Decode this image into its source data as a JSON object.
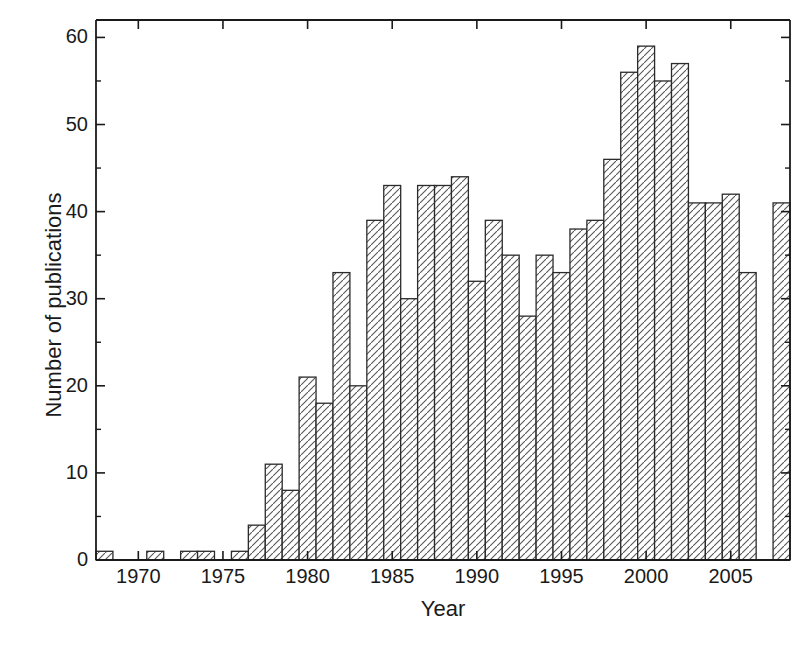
{
  "chart_data": {
    "type": "bar",
    "title": "",
    "subtitle": "",
    "xlabel": "Year",
    "ylabel": "Number of publications",
    "xlim": [
      1967.5,
      2008.5
    ],
    "ylim": [
      0,
      62
    ],
    "grid": false,
    "legend": null,
    "bar_style": {
      "fill": "#ffffff",
      "edge": "#2b2b2b",
      "hatch": "diagonal-forward-slash",
      "hatch_color": "#4a4a4a"
    },
    "axis_color": "#1a1a1a",
    "y_major_ticks": [
      0,
      10,
      20,
      30,
      40,
      50,
      60
    ],
    "y_minor_ticks": [
      5,
      15,
      25,
      35,
      45,
      55
    ],
    "y_tick_labels": [
      "0",
      "10",
      "20",
      "30",
      "40",
      "50",
      "60"
    ],
    "x_major_ticks": [
      1970,
      1975,
      1980,
      1985,
      1990,
      1995,
      2000,
      2005
    ],
    "x_tick_labels": [
      "1970",
      "1975",
      "1980",
      "1985",
      "1990",
      "1995",
      "2000",
      "2005"
    ],
    "categories": [
      1968,
      1969,
      1970,
      1971,
      1972,
      1973,
      1974,
      1975,
      1976,
      1977,
      1978,
      1979,
      1980,
      1981,
      1982,
      1983,
      1984,
      1985,
      1986,
      1987,
      1988,
      1989,
      1990,
      1991,
      1992,
      1993,
      1994,
      1995,
      1996,
      1997,
      1998,
      1999,
      2000,
      2001,
      2002,
      2003,
      2004,
      2005,
      2006,
      2007,
      2008
    ],
    "values": [
      1,
      0,
      0,
      1,
      0,
      1,
      1,
      0,
      1,
      4,
      11,
      8,
      21,
      18,
      33,
      20,
      39,
      43,
      30,
      43,
      43,
      44,
      32,
      39,
      35,
      28,
      35,
      33,
      38,
      39,
      46,
      56,
      59,
      55,
      57,
      41,
      41,
      42,
      33,
      0,
      41
    ]
  }
}
